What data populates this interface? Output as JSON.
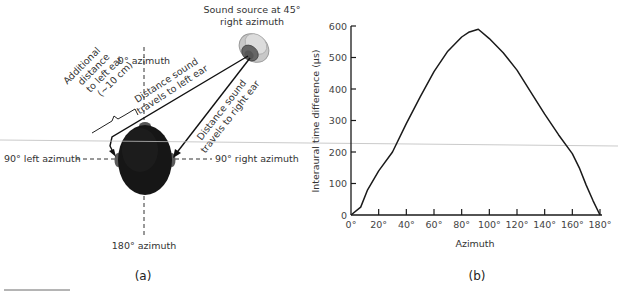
{
  "figure": {
    "panel_a": {
      "label": "(a)",
      "source_label_line1": "Sound source at 45°",
      "source_label_line2": "right azimuth",
      "azimuth_0": "0° azimuth",
      "azimuth_90_left": "90° left azimuth",
      "azimuth_90_right": "90° right azimuth",
      "azimuth_180": "180° azimuth",
      "left_path_line1": "Distance sound",
      "left_path_line2": "travels to left ear",
      "right_path_line1": "Distance sound",
      "right_path_line2": "travels to right ear",
      "additional_line1": "Additional",
      "additional_line2": "distance",
      "additional_line3": "to left ear",
      "additional_line4": "(~10 cm)"
    },
    "panel_b": {
      "label": "(b)"
    }
  },
  "chart_data": {
    "type": "line",
    "title": "",
    "xlabel": "Azimuth",
    "ylabel": "Interaural time difference (µs)",
    "xlim": [
      0,
      180
    ],
    "ylim": [
      0,
      600
    ],
    "grid": false,
    "legend": null,
    "x_ticks": [
      "0°",
      "20°",
      "40°",
      "60°",
      "80°",
      "100°",
      "120°",
      "140°",
      "160°",
      "180°"
    ],
    "y_ticks": [
      "0",
      "100",
      "200",
      "300",
      "400",
      "500",
      "600"
    ],
    "series": [
      {
        "name": "Interaural time difference",
        "x": [
          0,
          7,
          12,
          20,
          30,
          40,
          50,
          60,
          70,
          80,
          85,
          92,
          100,
          110,
          120,
          130,
          140,
          150,
          160,
          165,
          170,
          175,
          180
        ],
        "y": [
          0,
          25,
          80,
          140,
          200,
          290,
          375,
          455,
          520,
          565,
          580,
          590,
          560,
          515,
          460,
          390,
          320,
          255,
          195,
          150,
          95,
          45,
          0
        ]
      }
    ]
  }
}
